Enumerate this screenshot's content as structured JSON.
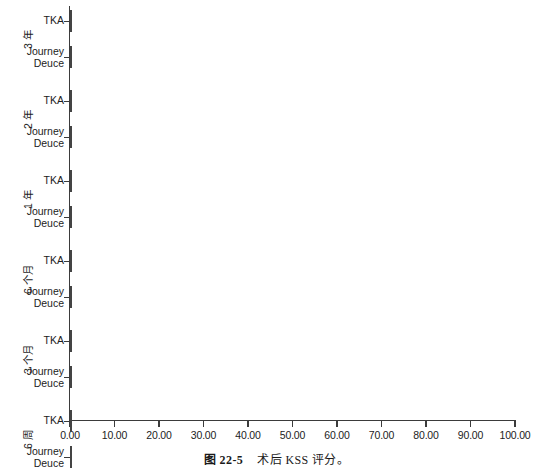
{
  "caption": {
    "figure_number": "图 22-5",
    "text": "术后 KSS 评分。"
  },
  "axis": {
    "x_tick_labels": [
      "0.00",
      "10.00",
      "20.00",
      "30.00",
      "40.00",
      "50.00",
      "60.00",
      "70.00",
      "80.00",
      "90.00",
      "100.00"
    ],
    "x_min": 0,
    "x_max": 100
  },
  "series_labels": {
    "tka": "TKA",
    "journey": "Journey\nDeuce"
  },
  "groups": [
    {
      "label": "3 年"
    },
    {
      "label": "2 年"
    },
    {
      "label": "1 年"
    },
    {
      "label": "6 个月"
    },
    {
      "label": "3 个月"
    },
    {
      "label": "6 周"
    },
    {
      "label": "术前"
    }
  ],
  "colors": {
    "tka_fill": "#fdfdfd",
    "journey_fill": "#a8a8a8",
    "bar_border": "#444444",
    "axis": "#3b3b3b",
    "text": "#1c1c1c"
  },
  "chart_data": {
    "type": "bar",
    "orientation": "horizontal",
    "title": "",
    "xlabel": "",
    "ylabel": "",
    "xlim": [
      0,
      100
    ],
    "grid": false,
    "legend_position": "none",
    "categories": [
      "3 年",
      "2 年",
      "1 年",
      "6 个月",
      "3 个月",
      "6 周",
      "术前"
    ],
    "series": [
      {
        "name": "TKA",
        "values": [
          93.5,
          85.0,
          93.5,
          87.0,
          83.5,
          80.0,
          75.5
        ]
      },
      {
        "name": "Journey Deuce",
        "values": [
          93.5,
          94.5,
          92.5,
          91.5,
          86.5,
          81.5,
          79.0
        ]
      }
    ]
  }
}
